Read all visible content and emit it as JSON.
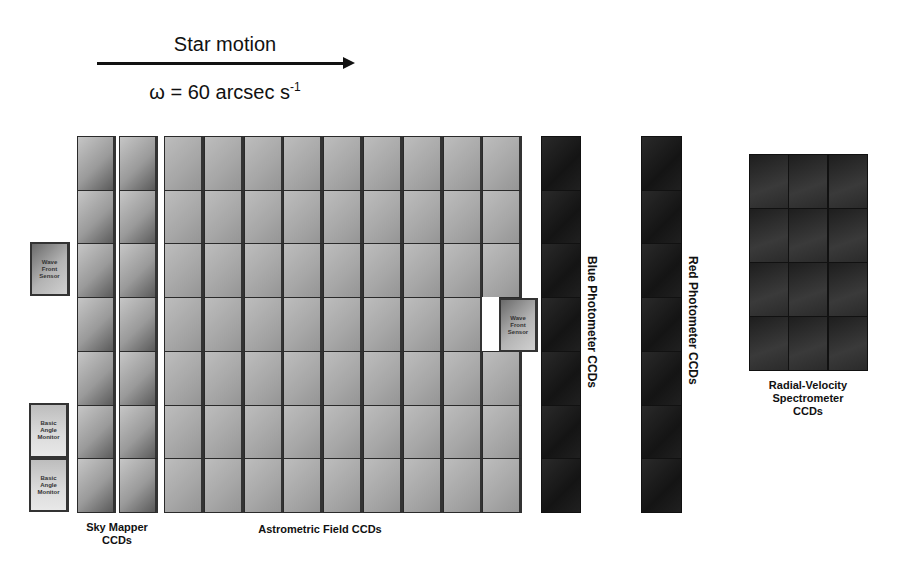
{
  "header": {
    "title": "Star motion",
    "rate_prefix": "ω = 60 arcsec s",
    "rate_exponent": "-1",
    "arrow_direction": "right"
  },
  "groups": {
    "sky_mapper": {
      "label_line1": "Sky Mapper",
      "label_line2": "CCDs",
      "columns": 2,
      "rows": 7
    },
    "astrometric": {
      "label": "Astrometric Field CCDs",
      "columns": 9,
      "rows": 7
    },
    "blue_photometer": {
      "label": "Blue Photometer CCDs",
      "columns": 1,
      "rows": 7
    },
    "red_photometer": {
      "label": "Red Photometer CCDs",
      "columns": 1,
      "rows": 7
    },
    "rvs": {
      "label_line1": "Radial-Velocity",
      "label_line2": "Spectrometer",
      "label_line3": "CCDs",
      "columns": 3,
      "rows": 4
    }
  },
  "aux_sensors": {
    "wfs_left": {
      "line1": "Wave",
      "line2": "Front",
      "line3": "Sensor"
    },
    "wfs_right": {
      "line1": "Wave",
      "line2": "Front",
      "line3": "Sensor"
    },
    "bam_top": {
      "line1": "Basic",
      "line2": "Angle",
      "line3": "Monitor"
    },
    "bam_bottom": {
      "line1": "Basic",
      "line2": "Angle",
      "line3": "Monitor"
    }
  }
}
